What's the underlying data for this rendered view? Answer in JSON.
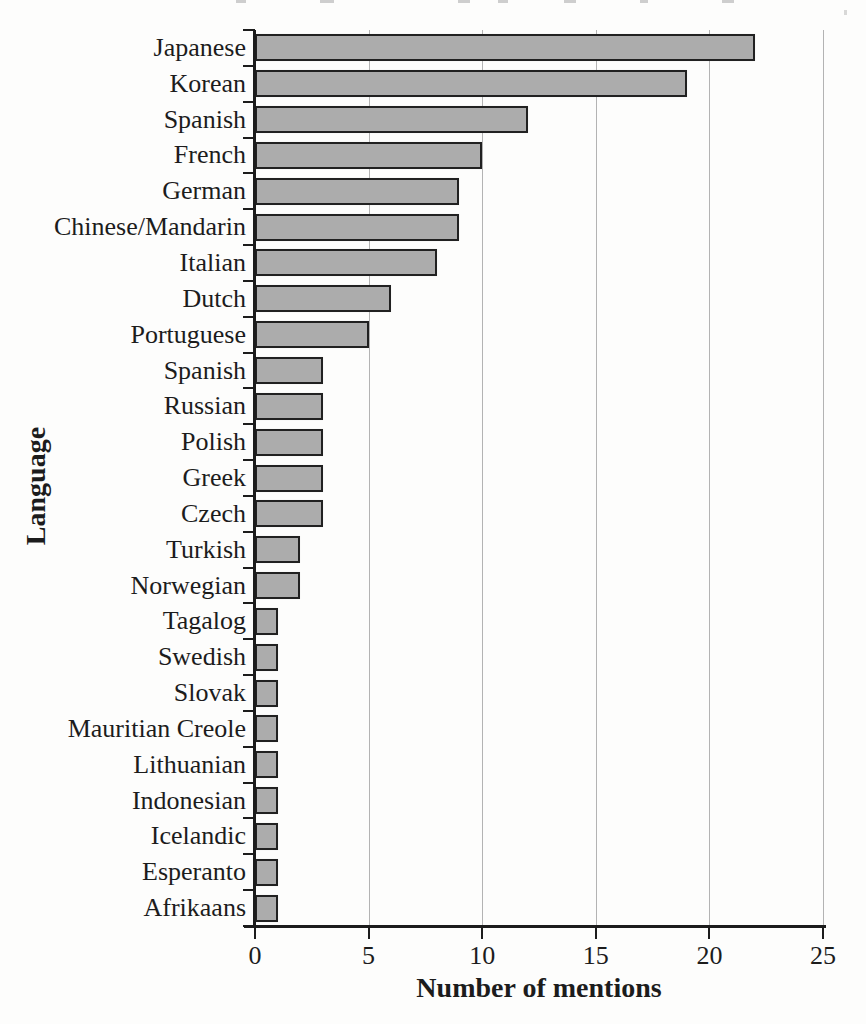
{
  "chart_data": {
    "type": "bar",
    "orientation": "horizontal",
    "categories": [
      "Japanese",
      "Korean",
      "Spanish",
      "French",
      "German",
      "Chinese/Mandarin",
      "Italian",
      "Dutch",
      "Portuguese",
      "Spanish",
      "Russian",
      "Polish",
      "Greek",
      "Czech",
      "Turkish",
      "Norwegian",
      "Tagalog",
      "Swedish",
      "Slovak",
      "Mauritian Creole",
      "Lithuanian",
      "Indonesian",
      "Icelandic",
      "Esperanto",
      "Afrikaans"
    ],
    "values": [
      22,
      19,
      12,
      10,
      9,
      9,
      8,
      6,
      5,
      3,
      3,
      3,
      3,
      3,
      2,
      2,
      1,
      1,
      1,
      1,
      1,
      1,
      1,
      1,
      1
    ],
    "xlabel": "Number of mentions",
    "ylabel": "Language",
    "xlim": [
      0,
      25
    ],
    "x_ticks": [
      0,
      5,
      10,
      15,
      20,
      25
    ],
    "x_tick_labels": [
      "0",
      "5",
      "10",
      "15",
      "20",
      "25"
    ],
    "grid": "vertical",
    "legend": "none",
    "bar_color": "#acacac",
    "bar_border_color": "#212121",
    "axis_color": "#1c1c1c",
    "gridline_color": "#a6a6a6"
  }
}
